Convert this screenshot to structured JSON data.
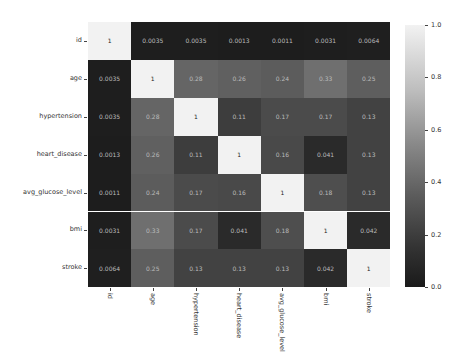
{
  "chart_data": {
    "type": "heatmap",
    "title": "",
    "xlabel": "",
    "ylabel": "",
    "row_labels": [
      "id",
      "age",
      "hypertension",
      "heart_disease",
      "avg_glucose_level",
      "bmi",
      "stroke"
    ],
    "col_labels": [
      "id",
      "age",
      "hypertension",
      "heart_disease",
      "avg_glucose_level",
      "bmi",
      "stroke"
    ],
    "values": [
      [
        1,
        0.0035,
        0.0035,
        0.0013,
        0.0011,
        0.0031,
        0.0064
      ],
      [
        0.0035,
        1,
        0.28,
        0.26,
        0.24,
        0.33,
        0.25
      ],
      [
        0.0035,
        0.28,
        1,
        0.11,
        0.17,
        0.17,
        0.13
      ],
      [
        0.0013,
        0.26,
        0.11,
        1,
        0.16,
        0.041,
        0.13
      ],
      [
        0.0011,
        0.24,
        0.17,
        0.16,
        1,
        0.18,
        0.13
      ],
      [
        0.0031,
        0.33,
        0.17,
        0.041,
        0.18,
        1,
        0.042
      ],
      [
        0.0064,
        0.25,
        0.13,
        0.13,
        0.13,
        0.042,
        1
      ]
    ],
    "annotations": [
      [
        "1",
        "0.0035",
        "0.0035",
        "0.0013",
        "0.0011",
        "0.0031",
        "0.0064"
      ],
      [
        "0.0035",
        "1",
        "0.28",
        "0.26",
        "0.24",
        "0.33",
        "0.25"
      ],
      [
        "0.0035",
        "0.28",
        "1",
        "0.11",
        "0.17",
        "0.17",
        "0.13"
      ],
      [
        "0.0013",
        "0.26",
        "0.11",
        "1",
        "0.16",
        "0.041",
        "0.13"
      ],
      [
        "0.0011",
        "0.24",
        "0.17",
        "0.16",
        "1",
        "0.18",
        "0.13"
      ],
      [
        "0.0031",
        "0.33",
        "0.17",
        "0.041",
        "0.18",
        "1",
        "0.042"
      ],
      [
        "0.0064",
        "0.25",
        "0.13",
        "0.13",
        "0.13",
        "0.042",
        "1"
      ]
    ],
    "colorbar": {
      "ticks": [
        "0.0",
        "0.2",
        "0.4",
        "0.6",
        "0.8",
        "1.0"
      ],
      "range": [
        0,
        1.0
      ],
      "colormap": "grayscale"
    },
    "grid": false,
    "legend_position": "right (colorbar)"
  }
}
